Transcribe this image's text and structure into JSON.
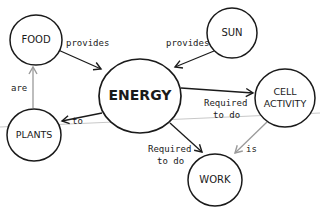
{
  "diagram": {
    "type": "concept-map",
    "colors": {
      "background": "#ffffff",
      "ink": "#1a1a1a",
      "gray_arrow": "#9a9a9a",
      "rule_line": "#c8c8c8"
    },
    "nodes": [
      {
        "id": "food",
        "label": "FOOD"
      },
      {
        "id": "sun",
        "label": "SUN"
      },
      {
        "id": "energy",
        "label": "ENERGY"
      },
      {
        "id": "cell_activity",
        "label_line1": "CELL",
        "label_line2": "ACTIVITY"
      },
      {
        "id": "plants",
        "label": "PLANTS"
      },
      {
        "id": "work",
        "label": "WORK"
      }
    ],
    "edges": [
      {
        "from": "food",
        "to": "energy",
        "label": "provides"
      },
      {
        "from": "sun",
        "to": "energy",
        "label": "provides"
      },
      {
        "from": "energy",
        "to": "plants",
        "label": "to"
      },
      {
        "from": "plants",
        "to": "food",
        "label": "are"
      },
      {
        "from": "energy",
        "to": "cell_activity",
        "label_line1": "Required",
        "label_line2": "to do"
      },
      {
        "from": "energy",
        "to": "work",
        "label_line1": "Required",
        "label_line2": "to do"
      },
      {
        "from": "cell_activity",
        "to": "work",
        "label": "is"
      }
    ]
  }
}
